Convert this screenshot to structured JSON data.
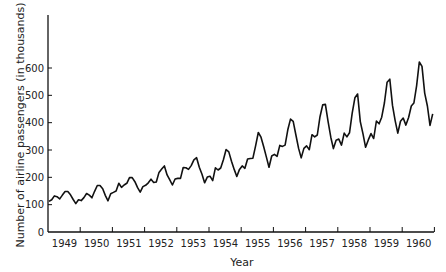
{
  "chart_data": {
    "type": "line",
    "title": "",
    "xlabel": "Year",
    "ylabel": "Number of airline passengers (in thousands)",
    "ylim": [
      0,
      700
    ],
    "yticks": [
      0,
      100,
      200,
      300,
      400,
      500,
      600
    ],
    "xtick_labels": [
      "1949",
      "1950",
      "1951",
      "1952",
      "1953",
      "1954",
      "1955",
      "1956",
      "1957",
      "1958",
      "1959",
      "1960"
    ],
    "grid": false,
    "series": [
      {
        "name": "Monthly airline passengers",
        "x_start": "1949-01",
        "frequency": "monthly",
        "values": [
          112,
          118,
          132,
          129,
          121,
          135,
          148,
          148,
          136,
          119,
          104,
          118,
          115,
          126,
          141,
          135,
          125,
          149,
          170,
          170,
          158,
          133,
          114,
          140,
          145,
          150,
          178,
          163,
          172,
          178,
          199,
          199,
          184,
          162,
          146,
          166,
          171,
          180,
          193,
          181,
          183,
          218,
          230,
          242,
          209,
          191,
          172,
          194,
          196,
          196,
          236,
          235,
          229,
          243,
          264,
          272,
          237,
          211,
          180,
          201,
          204,
          188,
          235,
          227,
          234,
          264,
          302,
          293,
          259,
          229,
          203,
          229,
          242,
          233,
          267,
          269,
          270,
          315,
          364,
          347,
          312,
          274,
          237,
          278,
          284,
          277,
          317,
          313,
          318,
          374,
          413,
          405,
          355,
          306,
          271,
          306,
          315,
          301,
          356,
          348,
          355,
          422,
          465,
          467,
          404,
          347,
          305,
          336,
          340,
          318,
          362,
          348,
          363,
          435,
          491,
          505,
          404,
          359,
          310,
          337,
          360,
          342,
          406,
          396,
          420,
          472,
          548,
          559,
          463,
          407,
          362,
          405,
          417,
          391,
          419,
          461,
          472,
          535,
          622,
          606,
          508,
          461,
          390,
          432
        ]
      }
    ]
  }
}
